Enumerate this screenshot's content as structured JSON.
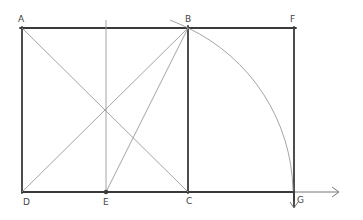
{
  "diagram": {
    "title": "",
    "type": "golden-rectangle-construction",
    "points": {
      "A": {
        "label": "A",
        "x": 22,
        "y": 28
      },
      "B": {
        "label": "B",
        "x": 188,
        "y": 28
      },
      "F": {
        "label": "F",
        "x": 294,
        "y": 28
      },
      "D": {
        "label": "D",
        "x": 22,
        "y": 192
      },
      "E": {
        "label": "E",
        "x": 106,
        "y": 192
      },
      "C": {
        "label": "C",
        "x": 188,
        "y": 192
      },
      "G": {
        "label": "G",
        "x": 294,
        "y": 192
      }
    },
    "labels": {
      "A": "A",
      "B": "B",
      "F": "F",
      "D": "D",
      "E": "E",
      "C": "C",
      "G": "G"
    },
    "segments": [
      {
        "from": "A",
        "to": "F",
        "style": "thick"
      },
      {
        "from": "D",
        "to": "G",
        "style": "thick"
      },
      {
        "from": "A",
        "to": "D",
        "style": "thick"
      },
      {
        "from": "B",
        "to": "C",
        "style": "thick"
      },
      {
        "from": "F",
        "to": "G",
        "style": "thick"
      },
      {
        "from": "A",
        "to": "C",
        "style": "thin"
      },
      {
        "from": "D",
        "to": "B",
        "style": "thin"
      },
      {
        "from": "E",
        "to": "B",
        "style": "thin"
      },
      {
        "from": "E",
        "to": "E_top",
        "style": "thin"
      }
    ],
    "arc": {
      "center": "E",
      "from": "B",
      "to": "G",
      "style": "thin"
    },
    "arrows": [
      {
        "name": "x-axis-arrow",
        "from": "G",
        "direction": "right"
      },
      {
        "name": "down-arrow",
        "from": "G",
        "direction": "down"
      }
    ],
    "colors": {
      "thick_stroke": "#3a3a3a",
      "thin_stroke": "#9a9a9a",
      "label": "#444444",
      "background": "#ffffff"
    }
  }
}
